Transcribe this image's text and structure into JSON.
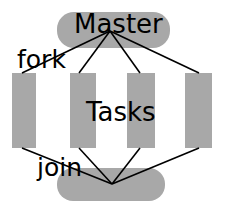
{
  "diagram": {
    "type": "fork-join-activity-diagram",
    "colors": {
      "node_fill": "#a8a8a8",
      "edge_stroke": "#000000",
      "label_color": "#000000",
      "background": "#ffffff"
    },
    "labels": [
      {
        "id": "master",
        "text": "Master",
        "x": 74,
        "y": 33,
        "font_size": 26
      },
      {
        "id": "fork",
        "text": "fork",
        "x": 17,
        "y": 68,
        "font_size": 25
      },
      {
        "id": "tasks",
        "text": "Tasks",
        "x": 86,
        "y": 121,
        "font_size": 26
      },
      {
        "id": "join",
        "text": "join",
        "x": 37,
        "y": 176,
        "font_size": 25
      }
    ],
    "nodes": [
      {
        "id": "master-bar",
        "name": "master-node",
        "shape": "rounded-rect",
        "x": 57,
        "y": 12,
        "width": 113,
        "height": 36,
        "rx": 17
      },
      {
        "id": "task-1",
        "name": "task-node-1",
        "shape": "rect",
        "x": 12,
        "y": 73,
        "width": 24,
        "height": 75,
        "rx": 0
      },
      {
        "id": "task-2",
        "name": "task-node-2",
        "shape": "rect",
        "x": 70,
        "y": 73,
        "width": 26,
        "height": 75,
        "rx": 0
      },
      {
        "id": "task-3",
        "name": "task-node-3",
        "shape": "rect",
        "x": 127,
        "y": 73,
        "width": 28,
        "height": 75,
        "rx": 0
      },
      {
        "id": "task-4",
        "name": "task-node-4",
        "shape": "rect",
        "x": 185,
        "y": 73,
        "width": 27,
        "height": 75,
        "rx": 0
      },
      {
        "id": "join-bar",
        "name": "join-node",
        "shape": "rounded-rect",
        "x": 57,
        "y": 168,
        "width": 108,
        "height": 33,
        "rx": 16
      }
    ],
    "fork_point": {
      "x": 110,
      "y": 31
    },
    "join_point": {
      "x": 112,
      "y": 184
    },
    "edges": [
      {
        "id": "fork-to-task-1",
        "from": "master-bar",
        "to": "task-1",
        "x1": 110,
        "y1": 31,
        "x2": 22,
        "y2": 73
      },
      {
        "id": "fork-to-task-2",
        "from": "master-bar",
        "to": "task-2",
        "x1": 110,
        "y1": 31,
        "x2": 79,
        "y2": 73
      },
      {
        "id": "fork-to-task-3",
        "from": "master-bar",
        "to": "task-3",
        "x1": 110,
        "y1": 31,
        "x2": 140,
        "y2": 73
      },
      {
        "id": "fork-to-task-4",
        "from": "master-bar",
        "to": "task-4",
        "x1": 110,
        "y1": 31,
        "x2": 199,
        "y2": 73
      },
      {
        "id": "task-1-to-join",
        "from": "task-1",
        "to": "join-bar",
        "x1": 22,
        "y1": 148,
        "x2": 112,
        "y2": 184
      },
      {
        "id": "task-2-to-join",
        "from": "task-2",
        "to": "join-bar",
        "x1": 79,
        "y1": 148,
        "x2": 112,
        "y2": 184
      },
      {
        "id": "task-3-to-join",
        "from": "task-3",
        "to": "join-bar",
        "x1": 140,
        "y1": 148,
        "x2": 112,
        "y2": 184
      },
      {
        "id": "task-4-to-join",
        "from": "task-4",
        "to": "join-bar",
        "x1": 199,
        "y1": 148,
        "x2": 112,
        "y2": 184
      }
    ]
  }
}
